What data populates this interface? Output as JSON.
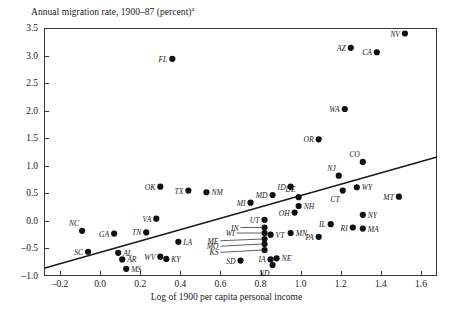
{
  "chart_data": {
    "type": "scatter",
    "title": "Annual migration rate, 1900–87 (percent)",
    "title_superscript": "a",
    "xlabel": "Log of 1900 per capita personal income",
    "ylabel": "",
    "xlim": [
      -0.28,
      1.68
    ],
    "ylim": [
      -1.0,
      3.5
    ],
    "xticks": [
      -0.2,
      0.0,
      0.2,
      0.4,
      0.6,
      0.8,
      1.0,
      1.2,
      1.4,
      1.6
    ],
    "xtick_labels": [
      "–0.2",
      "0.0",
      "0.2",
      "0.4",
      "0.6",
      "0.8",
      "1.0",
      "1.2",
      "1.4",
      "1.6"
    ],
    "yticks": [
      -1.0,
      -0.5,
      0.0,
      0.5,
      1.0,
      1.5,
      2.0,
      2.5,
      3.0,
      3.5
    ],
    "ytick_labels": [
      "–1.0",
      "–0.5",
      "0.0",
      "0.5",
      "1.0",
      "1.5",
      "2.0",
      "2.5",
      "3.0",
      "3.5"
    ],
    "grid": false,
    "legend": "none",
    "trend_line": {
      "x0": -0.28,
      "y0": -0.86,
      "x1": 1.68,
      "y1": 1.16
    },
    "points": [
      {
        "label": "NV",
        "x": 1.52,
        "y": 3.4,
        "pos": "left"
      },
      {
        "label": "AZ",
        "x": 1.25,
        "y": 3.14,
        "pos": "left"
      },
      {
        "label": "CA",
        "x": 1.38,
        "y": 3.06,
        "pos": "left"
      },
      {
        "label": "FL",
        "x": 0.36,
        "y": 2.94,
        "pos": "left"
      },
      {
        "label": "WA",
        "x": 1.22,
        "y": 2.03,
        "pos": "left"
      },
      {
        "label": "OR",
        "x": 1.09,
        "y": 1.48,
        "pos": "left"
      },
      {
        "label": "CO",
        "x": 1.31,
        "y": 1.07,
        "pos": "above"
      },
      {
        "label": "NJ",
        "x": 1.19,
        "y": 0.82,
        "pos": "above"
      },
      {
        "label": "WY",
        "x": 1.28,
        "y": 0.61,
        "pos": "right"
      },
      {
        "label": "OK",
        "x": 0.3,
        "y": 0.62,
        "pos": "left"
      },
      {
        "label": "ID",
        "x": 0.95,
        "y": 0.62,
        "pos": "left"
      },
      {
        "label": "CT",
        "x": 1.21,
        "y": 0.55,
        "pos": "below"
      },
      {
        "label": "TX",
        "x": 0.44,
        "y": 0.55,
        "pos": "left"
      },
      {
        "label": "NM",
        "x": 0.53,
        "y": 0.52,
        "pos": "right"
      },
      {
        "label": "MD",
        "x": 0.86,
        "y": 0.47,
        "pos": "left"
      },
      {
        "label": "DE",
        "x": 0.99,
        "y": 0.43,
        "pos": "above"
      },
      {
        "label": "MT",
        "x": 1.49,
        "y": 0.44,
        "pos": "left"
      },
      {
        "label": "MI",
        "x": 0.75,
        "y": 0.33,
        "pos": "left"
      },
      {
        "label": "NH",
        "x": 0.99,
        "y": 0.27,
        "pos": "right"
      },
      {
        "label": "OH",
        "x": 0.97,
        "y": 0.15,
        "pos": "left"
      },
      {
        "label": "VA",
        "x": 0.28,
        "y": 0.04,
        "pos": "left"
      },
      {
        "label": "NY",
        "x": 1.31,
        "y": 0.11,
        "pos": "right"
      },
      {
        "label": "UT",
        "x": 0.82,
        "y": 0.02,
        "pos": "left"
      },
      {
        "label": "IL",
        "x": 1.15,
        "y": -0.06,
        "pos": "left"
      },
      {
        "label": "RI",
        "x": 1.26,
        "y": -0.12,
        "pos": "left"
      },
      {
        "label": "MA",
        "x": 1.31,
        "y": -0.14,
        "pos": "right"
      },
      {
        "label": "NC",
        "x": -0.09,
        "y": -0.18,
        "pos": "above"
      },
      {
        "label": "TN",
        "x": 0.23,
        "y": -0.21,
        "pos": "left"
      },
      {
        "label": "GA",
        "x": 0.07,
        "y": -0.23,
        "pos": "left"
      },
      {
        "label": "IN",
        "x": 0.82,
        "y": -0.12,
        "pos": "leader"
      },
      {
        "label": "WI",
        "x": 0.82,
        "y": -0.22,
        "pos": "leader"
      },
      {
        "label": "VT",
        "x": 0.85,
        "y": -0.25,
        "pos": "right"
      },
      {
        "label": "ME",
        "x": 0.82,
        "y": -0.33,
        "pos": "leader"
      },
      {
        "label": "MN",
        "x": 0.95,
        "y": -0.22,
        "pos": "right"
      },
      {
        "label": "PA",
        "x": 1.09,
        "y": -0.29,
        "pos": "left"
      },
      {
        "label": "MO",
        "x": 0.82,
        "y": -0.42,
        "pos": "leader"
      },
      {
        "label": "LA",
        "x": 0.39,
        "y": -0.38,
        "pos": "right"
      },
      {
        "label": "SC",
        "x": -0.06,
        "y": -0.56,
        "pos": "left"
      },
      {
        "label": "AL",
        "x": 0.09,
        "y": -0.58,
        "pos": "right"
      },
      {
        "label": "KS",
        "x": 0.82,
        "y": -0.53,
        "pos": "leader"
      },
      {
        "label": "WV",
        "x": 0.3,
        "y": -0.65,
        "pos": "left"
      },
      {
        "label": "KY",
        "x": 0.33,
        "y": -0.69,
        "pos": "right"
      },
      {
        "label": "AR",
        "x": 0.11,
        "y": -0.7,
        "pos": "right"
      },
      {
        "label": "SD",
        "x": 0.7,
        "y": -0.72,
        "pos": "left"
      },
      {
        "label": "IA",
        "x": 0.85,
        "y": -0.7,
        "pos": "left"
      },
      {
        "label": "NE",
        "x": 0.88,
        "y": -0.68,
        "pos": "right"
      },
      {
        "label": "ND",
        "x": 0.86,
        "y": -0.8,
        "pos": "below"
      },
      {
        "label": "MS",
        "x": 0.13,
        "y": -0.87,
        "pos": "right"
      }
    ],
    "leader_anchors": [
      {
        "label": "IN",
        "lx": 0.7,
        "ly": -0.12
      },
      {
        "label": "WI",
        "lx": 0.68,
        "ly": -0.22
      },
      {
        "label": "ME",
        "lx": 0.6,
        "ly": -0.36
      },
      {
        "label": "MO",
        "lx": 0.6,
        "ly": -0.46
      },
      {
        "label": "KS",
        "lx": 0.6,
        "ly": -0.57
      }
    ]
  }
}
